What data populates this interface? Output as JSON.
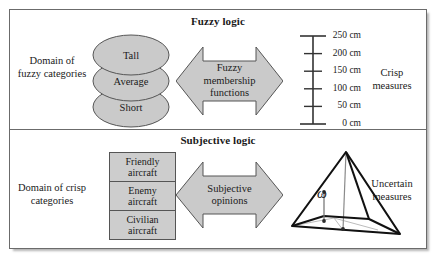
{
  "frame": {
    "accent_gray": "#cdcdcd",
    "line_color": "#333333",
    "border_color": "#6b6b6b"
  },
  "panels": [
    {
      "id": "fuzzy",
      "title": "Fuzzy logic",
      "left_label": "Domain of fuzzy categories",
      "right_label": "Crisp measures",
      "arrow_label_lines": [
        "Fuzzy",
        "membership",
        "functions"
      ],
      "categories": [
        "Tall",
        "Average",
        "Short"
      ]
    },
    {
      "id": "subjective",
      "title": "Subjective logic",
      "left_label": "Domain of crisp categories",
      "right_label": "Uncertain measures",
      "arrow_label_lines": [
        "Subjective",
        "opinions"
      ],
      "categories": [
        {
          "line1": "Friendly",
          "line2": "aircraft"
        },
        {
          "line1": "Enemy",
          "line2": "aircraft"
        },
        {
          "line1": "Civilian",
          "line2": "aircraft"
        }
      ],
      "opinion_symbol": "ω"
    }
  ],
  "ruler": {
    "unit": "cm",
    "ticks": [
      {
        "label": "250 cm",
        "value": 250
      },
      {
        "label": "200 cm",
        "value": 200
      },
      {
        "label": "150 cm",
        "value": 150
      },
      {
        "label": "100 cm",
        "value": 100
      },
      {
        "label": "50 cm",
        "value": 50
      },
      {
        "label": "0 cm",
        "value": 0
      }
    ]
  }
}
